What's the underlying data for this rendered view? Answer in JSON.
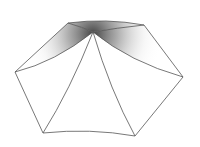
{
  "figure": {
    "stroke_color": "#555555",
    "shade_color": "#3a3a3a",
    "background": "#ffffff"
  }
}
